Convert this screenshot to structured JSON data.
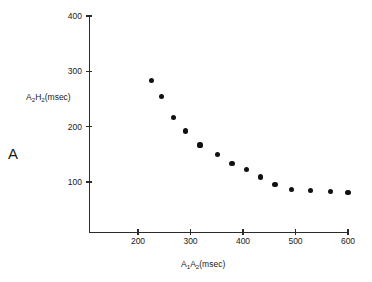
{
  "figure": {
    "panel_letter": "A",
    "background_color": "#ffffff",
    "marker_color": "#111111",
    "axis_color": "#2b2b2b"
  },
  "chart_data": {
    "type": "scatter",
    "title": "",
    "xlabel": "A1A2(msec)",
    "ylabel": "A2H2(msec)",
    "xlabel_parts": {
      "pre": "A",
      "sub1": "1",
      "mid": "A",
      "sub2": "2",
      "post": "(msec)"
    },
    "ylabel_parts": {
      "pre": "A",
      "sub1": "2",
      "mid": "H",
      "sub2": "2",
      "post": "(msec)"
    },
    "xlim": [
      140,
      610
    ],
    "ylim": [
      0,
      400
    ],
    "xticks": [
      200,
      300,
      400,
      500,
      600
    ],
    "yticks": [
      100,
      200,
      300,
      400
    ],
    "xtick_labels": [
      "200",
      "300",
      "400",
      "500",
      "600"
    ],
    "ytick_labels": [
      "100",
      "200",
      "300",
      "400"
    ],
    "grid": false,
    "legend": null,
    "series": [
      {
        "name": "A2H2 vs A1A2",
        "x": [
          225,
          244,
          267,
          290,
          318,
          352,
          379,
          406,
          433,
          461,
          493,
          529,
          566,
          600
        ],
        "y": [
          284,
          254,
          216,
          192,
          167,
          149,
          134,
          122,
          109,
          96,
          87,
          85,
          83,
          81
        ]
      }
    ],
    "annotations": [
      {
        "text": "A",
        "role": "panel-label"
      }
    ]
  }
}
